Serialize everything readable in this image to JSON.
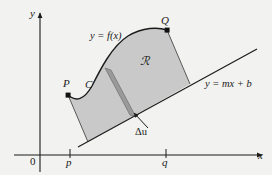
{
  "figure": {
    "background_color": "#f2f2f0",
    "ink_color": "#1b1b1b",
    "region_fill": "#c9c9c9",
    "strip_fill": "#9a9a9a"
  },
  "axes": {
    "y_label": "y",
    "x_label": "x",
    "origin_label": "0",
    "x_ticks": [
      {
        "label": "p",
        "x": 70
      },
      {
        "label": "q",
        "x": 166
      }
    ]
  },
  "labels": {
    "point_P": "P",
    "point_Q": "Q",
    "curve_C": "C",
    "curve_equation": "y = f(x)",
    "line_equation": "y = mx + b",
    "region": "ℛ",
    "strip_delta": "Δu"
  },
  "geometry": {
    "point_P": {
      "x": 68,
      "y": 95
    },
    "point_Q": {
      "x": 167,
      "y": 30
    },
    "line_start": {
      "x": 78,
      "y": 147
    },
    "line_end": {
      "x": 257,
      "y": 49
    },
    "region_left_foot": {
      "x": 88,
      "y": 142
    },
    "region_right_foot": {
      "x": 190,
      "y": 84
    },
    "strip_top": {
      "x": 108,
      "y": 69
    },
    "strip_bottom": {
      "x": 133,
      "y": 116
    },
    "strip_width": 6
  }
}
